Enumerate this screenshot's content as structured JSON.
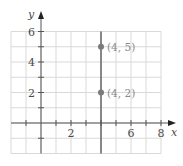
{
  "chart_data": {
    "type": "scatter",
    "title": "",
    "xlabel": "x",
    "ylabel": "y",
    "xlim": [
      -2,
      8
    ],
    "ylim": [
      -2,
      6
    ],
    "grid": true,
    "x_tick_labels": [
      "2",
      "6",
      "8"
    ],
    "x_tick_values": [
      2,
      6,
      8
    ],
    "y_tick_labels": [
      "2",
      "4",
      "6"
    ],
    "y_tick_values": [
      2,
      4,
      6
    ],
    "series": [
      {
        "name": "points",
        "points": [
          {
            "x": 4,
            "y": 5,
            "label": "(4, 5)"
          },
          {
            "x": 4,
            "y": 2,
            "label": "(4, 2)"
          }
        ]
      }
    ],
    "vertical_lines": [
      {
        "x": 4
      }
    ],
    "colors": {
      "grid": "#d9d9d9",
      "axis": "#555555",
      "vline": "#6e6e6e",
      "point": "#7a7a7a",
      "label": "#8a8a8a"
    }
  }
}
